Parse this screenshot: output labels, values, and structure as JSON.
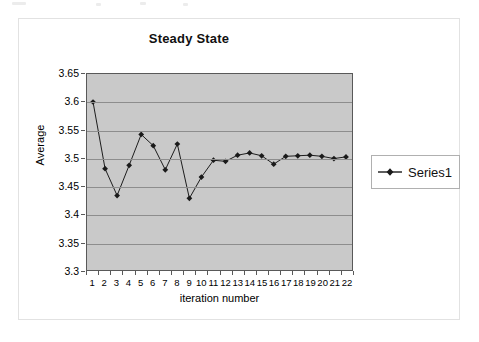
{
  "chart_data": {
    "type": "line",
    "title": "Steady State",
    "xlabel": "iteration number",
    "ylabel": "Average",
    "grid": true,
    "legend_position": "right",
    "xlim": [
      0.5,
      22.5
    ],
    "ylim": [
      3.3,
      3.65
    ],
    "ytick_labels": [
      "3.65",
      "3.6",
      "3.55",
      "3.5",
      "3.45",
      "3.4",
      "3.35",
      "3.3"
    ],
    "ytick_values": [
      3.65,
      3.6,
      3.55,
      3.5,
      3.45,
      3.4,
      3.35,
      3.3
    ],
    "categories": [
      1,
      2,
      3,
      4,
      5,
      6,
      7,
      8,
      9,
      10,
      11,
      12,
      13,
      14,
      15,
      16,
      17,
      18,
      19,
      20,
      21,
      22
    ],
    "xtick_labels": [
      "1",
      "2",
      "3",
      "4",
      "5",
      "6",
      "7",
      "8",
      "9",
      "10",
      "11",
      "12",
      "13",
      "14",
      "15",
      "16",
      "17",
      "18",
      "19",
      "20",
      "21",
      "22"
    ],
    "series": [
      {
        "name": "Series1",
        "marker": "diamond",
        "color": "#1a1a1a",
        "values": [
          3.6,
          3.481,
          3.433,
          3.487,
          3.542,
          3.522,
          3.479,
          3.525,
          3.428,
          3.466,
          3.496,
          3.494,
          3.505,
          3.509,
          3.504,
          3.489,
          3.503,
          3.504,
          3.505,
          3.503,
          3.499,
          3.502
        ]
      }
    ],
    "plot_background": "#c9c9c9",
    "gridline_color": "#8d8d8d",
    "axis_color": "#595959"
  },
  "legend": {
    "entries": [
      {
        "label": "Series1"
      }
    ]
  }
}
